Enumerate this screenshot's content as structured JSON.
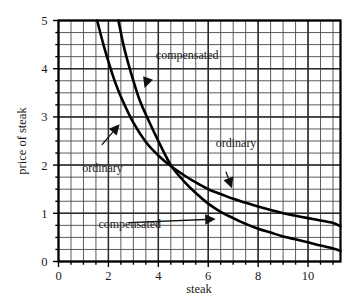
{
  "chart_data": {
    "type": "line",
    "title": "",
    "subtitle": "",
    "xlabel": "steak",
    "ylabel": "price of steak",
    "xlim": [
      0,
      11.3
    ],
    "ylim": [
      0,
      5
    ],
    "x_ticks": [
      0,
      2,
      4,
      6,
      8,
      10
    ],
    "y_ticks": [
      0,
      1,
      2,
      3,
      4,
      5
    ],
    "x_tick_labels": [
      "0",
      "2",
      "4",
      "6",
      "8",
      "10"
    ],
    "y_tick_labels": [
      "0",
      "1",
      "2",
      "3",
      "4",
      "5"
    ],
    "x_minor_step": 0.5,
    "y_minor_step": 0.25,
    "grid": true,
    "grid_style": "full rectangular mesh, minor lines both axes",
    "legend": "none (inline annotated labels with arrows)",
    "series": [
      {
        "name": "ordinary",
        "description": "ordinary (Marshallian) demand curve for steak; flatter hyperbola, lies right of compensated curve at low quantities and above it at high quantities",
        "x": [
          1.55,
          1.8,
          2.0,
          2.25,
          2.5,
          3.0,
          3.5,
          4.0,
          4.5,
          5.0,
          5.5,
          6.0,
          6.5,
          7.0,
          7.5,
          8.0,
          8.5,
          9.0,
          9.5,
          10.0,
          10.5,
          11.0,
          11.3
        ],
        "y": [
          5.0,
          4.5,
          4.15,
          3.75,
          3.42,
          2.88,
          2.48,
          2.2,
          1.98,
          1.8,
          1.64,
          1.5,
          1.4,
          1.3,
          1.22,
          1.14,
          1.07,
          1.0,
          0.95,
          0.9,
          0.85,
          0.8,
          0.73
        ]
      },
      {
        "name": "compensated",
        "description": "compensated (Hicksian) demand curve for steak; steeper hyperbola, crosses the ordinary curve near (4.5, 2.0)",
        "x": [
          2.4,
          2.6,
          2.8,
          3.0,
          3.25,
          3.5,
          4.0,
          4.5,
          5.0,
          5.5,
          6.0,
          6.5,
          7.0,
          7.5,
          8.0,
          8.5,
          9.0,
          9.5,
          10.0,
          10.5,
          11.0,
          11.3
        ],
        "y": [
          5.0,
          4.5,
          4.1,
          3.75,
          3.35,
          3.05,
          2.5,
          2.0,
          1.68,
          1.42,
          1.2,
          1.03,
          0.9,
          0.78,
          0.68,
          0.6,
          0.52,
          0.46,
          0.4,
          0.33,
          0.27,
          0.22
        ]
      }
    ],
    "crossing_point": {
      "x": 4.5,
      "y": 2.0
    },
    "annotations": [
      {
        "text": "compensated",
        "label_x": 3.9,
        "label_y": 4.28,
        "points_to_x": 3.45,
        "points_to_y": 3.6,
        "target_series": "compensated",
        "arrow_direction": "down-left"
      },
      {
        "text": "ordinary",
        "label_x": 0.95,
        "label_y": 1.95,
        "points_to_x": 2.45,
        "points_to_y": 2.85,
        "target_series": "ordinary",
        "arrow_direction": "up-right"
      },
      {
        "text": "ordinary",
        "label_x": 6.3,
        "label_y": 2.45,
        "points_to_x": 6.95,
        "points_to_y": 1.52,
        "target_series": "ordinary",
        "arrow_direction": "down"
      },
      {
        "text": "compensated",
        "label_x": 1.6,
        "label_y": 0.78,
        "points_to_x": 6.3,
        "points_to_y": 0.88,
        "target_series": "compensated",
        "arrow_direction": "right"
      }
    ],
    "colors": {
      "curve": "#000000",
      "grid_minor": "#4a4a4a",
      "grid_major": "#2b2b2b",
      "axis": "#000000",
      "background": "#ffffff",
      "text": "#1a1a1a"
    }
  }
}
